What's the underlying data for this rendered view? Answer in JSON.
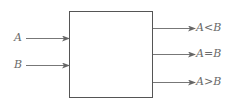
{
  "diagram": {
    "title": "",
    "colors": {
      "stroke": "#555555",
      "text": "#6a6a6a",
      "background": "#ffffff"
    },
    "block": {
      "label": ""
    },
    "inputs": [
      {
        "label": "A"
      },
      {
        "label": "B"
      }
    ],
    "outputs": [
      {
        "label": "A<B"
      },
      {
        "label": "A=B"
      },
      {
        "label": "A>B"
      }
    ]
  }
}
